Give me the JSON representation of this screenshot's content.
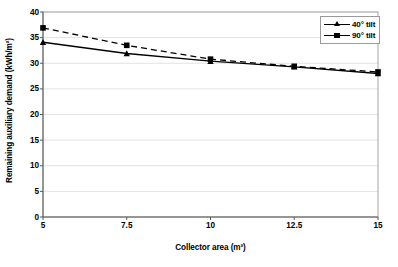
{
  "chart_data": {
    "type": "line",
    "title": "",
    "xlabel": "Collector area (m²)",
    "ylabel": "Remaining auxiliary demand (kWh/m²)",
    "x": [
      5,
      7.5,
      10,
      12.5,
      15
    ],
    "xtick_labels": [
      "5",
      "7.5",
      "10",
      "12.5",
      "15"
    ],
    "ytick_labels": [
      "0",
      "5",
      "10",
      "15",
      "20",
      "25",
      "30",
      "35",
      "40"
    ],
    "yticks": [
      0,
      5,
      10,
      15,
      20,
      25,
      30,
      35,
      40
    ],
    "xlim": [
      5,
      15
    ],
    "ylim": [
      0,
      40
    ],
    "grid": "horizontal",
    "legend_position": "top-right",
    "series": [
      {
        "name": "40° tilt",
        "values": [
          34.1,
          31.9,
          30.4,
          29.3,
          28.0
        ],
        "line_style": "solid",
        "marker": "triangle",
        "color": "#000000"
      },
      {
        "name": "90° tilt",
        "values": [
          36.9,
          33.5,
          30.8,
          29.4,
          28.3
        ],
        "line_style": "dashed",
        "marker": "square",
        "color": "#000000"
      }
    ]
  },
  "axes": {
    "y_title": "Remaining auxiliary demand (kWh/m²)",
    "x_title": "Collector area (m²)"
  },
  "legend": {
    "items": [
      {
        "label": "40° tilt"
      },
      {
        "label": "90° tilt"
      }
    ]
  },
  "colors": {
    "series": "#000000",
    "grid": "#e2e2e2",
    "plot_border": "#a6a6a6",
    "axis": "#808080",
    "background": "#ffffff"
  }
}
